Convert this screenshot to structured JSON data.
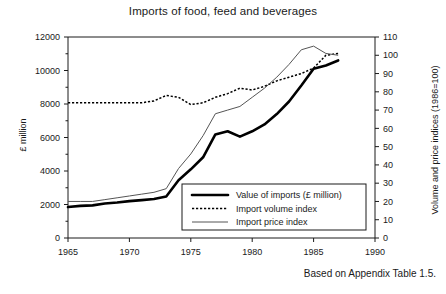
{
  "chart_data": {
    "type": "line",
    "title": "Imports of food, feed and beverages",
    "source_note": "Based on Appendix Table 1.5.",
    "xlabel": "",
    "ylabel": "£ million",
    "ylabel_right": "Volume and price indices (1986=100)",
    "xlim": [
      1965,
      1990
    ],
    "ylim": [
      0,
      12000
    ],
    "ylim_right": [
      0,
      110
    ],
    "xticks": [
      1965,
      1970,
      1975,
      1980,
      1985,
      1990
    ],
    "yticks": [
      0,
      2000,
      4000,
      6000,
      8000,
      10000,
      12000
    ],
    "yticks_right": [
      0,
      10,
      20,
      30,
      40,
      50,
      60,
      70,
      80,
      90,
      100,
      110
    ],
    "grid": false,
    "legend_position": "inside lower center",
    "x": [
      1965,
      1966,
      1967,
      1968,
      1969,
      1970,
      1971,
      1972,
      1973,
      1974,
      1975,
      1976,
      1977,
      1978,
      1979,
      1980,
      1981,
      1982,
      1983,
      1984,
      1985,
      1986,
      1987
    ],
    "series": [
      {
        "name": "Value of imports (£ million)",
        "axis": "left",
        "unit": "£ million",
        "style": "thick-solid",
        "color": "#000000",
        "values": [
          1850,
          1920,
          1950,
          2060,
          2120,
          2200,
          2260,
          2330,
          2480,
          3450,
          4100,
          4820,
          6180,
          6370,
          6050,
          6370,
          6780,
          7400,
          8150,
          9100,
          10100,
          10300,
          10600
        ]
      },
      {
        "name": "Import volume index",
        "axis": "right",
        "unit": "index (1986=100)",
        "style": "dotted",
        "color": "#000000",
        "values": [
          74,
          74,
          74,
          74,
          74,
          74,
          74,
          75,
          78,
          77,
          73,
          74,
          77,
          79,
          82,
          81,
          83,
          86,
          88,
          90,
          93,
          100,
          101
        ]
      },
      {
        "name": "Import price index",
        "axis": "right",
        "unit": "index (1986=100)",
        "style": "thin-dashdot",
        "color": "#555555",
        "values": [
          20,
          20,
          20,
          21,
          22,
          23,
          24,
          25,
          27,
          38,
          46,
          56,
          68,
          70,
          72,
          77,
          82,
          88,
          95,
          103,
          105,
          101,
          100
        ]
      }
    ]
  }
}
